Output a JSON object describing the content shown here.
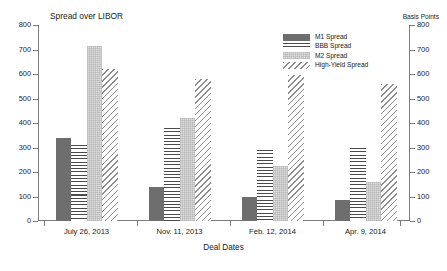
{
  "chart_data": {
    "type": "bar",
    "title": "Spread over LIBOR",
    "xlabel": "Deal Dates",
    "ylabel": "Spread over LIBOR",
    "ylabel_right": "Basis Points",
    "ylim": [
      0,
      800
    ],
    "yticks": [
      0,
      100,
      200,
      300,
      400,
      500,
      600,
      700,
      800
    ],
    "yticks_right": [
      0,
      100,
      200,
      300,
      400,
      500,
      600,
      700,
      800
    ],
    "grid": false,
    "legend_position": "top-right",
    "categories": [
      "July 26, 2013",
      "Nov. 11, 2013",
      "Feb. 12, 2014",
      "Apr. 9, 2014"
    ],
    "series": [
      {
        "name": "M1 Spread",
        "pattern": "solid-dark-gray",
        "color": "#6e6e6e",
        "values": [
          340,
          140,
          100,
          85
        ]
      },
      {
        "name": "BBB Spread",
        "pattern": "horizontal-lines",
        "color": "#4a4a4a",
        "values": [
          310,
          380,
          290,
          300
        ]
      },
      {
        "name": "M2 Spread",
        "pattern": "light-gray-stipple",
        "color": "#dedede",
        "values": [
          715,
          420,
          225,
          160
        ]
      },
      {
        "name": "High-Yield Spread",
        "pattern": "diagonal-hatch",
        "color": "#8d8d8d",
        "values": [
          620,
          580,
          595,
          560
        ]
      }
    ]
  },
  "axis": {
    "y_tick_labels": [
      "800",
      "700",
      "600",
      "500",
      "400",
      "300",
      "200",
      "100",
      "0"
    ],
    "y_tick_labels_right": [
      "800",
      "700",
      "600",
      "500",
      "400",
      "300",
      "200",
      "100",
      "0"
    ]
  }
}
